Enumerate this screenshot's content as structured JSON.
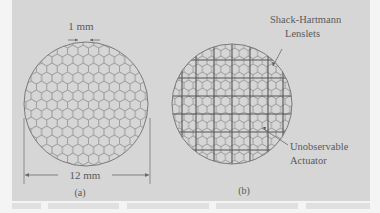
{
  "figure": {
    "panel_a": {
      "pitch_label": "1 mm",
      "diameter_label": "12 mm",
      "caption": "(a)"
    },
    "panel_b": {
      "lenslet_label_line1": "Shack-Hartmann",
      "lenslet_label_line2": "Lenslets",
      "actuator_label_line1": "Unobservable",
      "actuator_label_line2": "Actuator",
      "caption": "(b)"
    },
    "colors": {
      "background": "#d6d6d6",
      "line": "#7a7a7a",
      "grid": "#555555"
    }
  }
}
